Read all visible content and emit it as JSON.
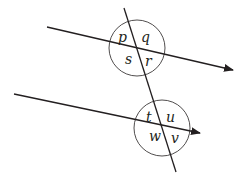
{
  "diagram": {
    "colors": {
      "stroke": "#231f20",
      "background": "#ffffff"
    },
    "upper_line": {
      "x1": 47,
      "y1": 27,
      "x2": 233,
      "y2": 70,
      "arrow": "end"
    },
    "lower_line": {
      "x1": 14,
      "y1": 94,
      "x2": 200,
      "y2": 133,
      "arrow": "end"
    },
    "transversal": {
      "x1": 124,
      "y1": 8,
      "x2": 176,
      "y2": 172
    },
    "upper_intersection": {
      "cx": 137,
      "cy": 48,
      "r": 28,
      "angles": {
        "top_left": "p",
        "top_right": "q",
        "bottom_left": "s",
        "bottom_right": "r"
      }
    },
    "lower_intersection": {
      "cx": 162,
      "cy": 128,
      "r": 28,
      "angles": {
        "top_left": "t",
        "top_right": "u",
        "bottom_left": "w",
        "bottom_right": "v"
      }
    }
  }
}
